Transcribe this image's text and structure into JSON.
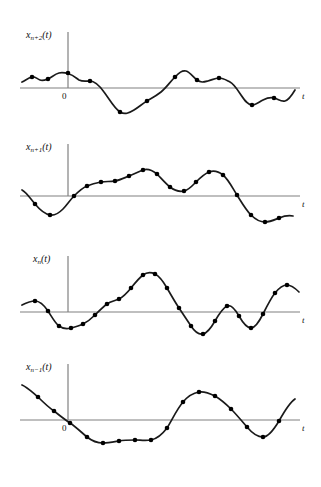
{
  "figure": {
    "kind": "multi-panel-waveform-diagram",
    "background_color": "#ffffff",
    "stroke_color": "#1a1a1a",
    "axis_color": "#808080",
    "sample_dot_color": "#000000",
    "width": 321,
    "height": 487
  },
  "ellipsis_top": {
    "name": "vertical-ellipsis-top",
    "dot_count": 3,
    "x": 158,
    "ys": [
      19,
      32,
      45
    ]
  },
  "ellipsis_bottom": {
    "name": "vertical-ellipsis-bottom",
    "dot_count": 3,
    "x": 158,
    "ys": [
      452,
      465,
      478
    ]
  },
  "panels": [
    {
      "id": "panel-xn-plus-2",
      "signal_label": "x",
      "signal_subscript": "n+2",
      "signal_arg": "(t)",
      "signal_label_full": "x_{n+2}(t)",
      "zero_label": "0",
      "t_label": "t",
      "top": 28,
      "baseline_y": 88,
      "y_axis_x": 68,
      "x_axis_from": 20,
      "x_axis_to": 300,
      "y_axis_top": 32,
      "label_x": 26,
      "label_y": 30,
      "zero_x": 62,
      "zero_y": 92,
      "t_x": 302,
      "t_y": 92,
      "curve": "M 22,82 C 26,80 28,78 32,77 C 35,76 37,79 40,80 C 43,81 45,80 48,79 C 52,77 55,74 59,73 C 63,72 66,73 69,74 C 73,75 76,78 79,80 C 83,82 86,81 90,81 C 95,81 99,85 104,92 C 110,100 114,108 120,112 C 125,115 129,113 134,110 C 139,107 142,104 147,101 C 152,98 156,96 161,92 C 166,88 170,82 175,77 C 179,73 182,70 186,71 C 190,72 193,77 197,80 C 201,83 204,82 208,81 C 212,80 215,78 219,78 C 223,78 226,80 230,82 C 234,84 237,89 241,95 C 245,101 248,105 252,105 C 256,105 259,102 263,100 C 267,98 270,97 274,98 C 278,99 281,102 285,101 C 289,100 292,95 295,90",
      "samples": [
        {
          "x": 32,
          "y": 77
        },
        {
          "x": 48,
          "y": 79
        },
        {
          "x": 68,
          "y": 73
        },
        {
          "x": 90,
          "y": 81
        },
        {
          "x": 120,
          "y": 112
        },
        {
          "x": 147,
          "y": 101
        },
        {
          "x": 175,
          "y": 77
        },
        {
          "x": 197,
          "y": 80
        },
        {
          "x": 219,
          "y": 78
        },
        {
          "x": 252,
          "y": 105
        },
        {
          "x": 274,
          "y": 98
        }
      ]
    },
    {
      "id": "panel-xn-plus-1",
      "signal_label": "x",
      "signal_subscript": "n+1",
      "signal_arg": "(t)",
      "signal_label_full": "x_{n+1}(t)",
      "zero_label": "",
      "t_label": "t",
      "top": 140,
      "baseline_y": 196,
      "y_axis_x": 68,
      "x_axis_from": 20,
      "x_axis_to": 300,
      "y_axis_top": 144,
      "label_x": 26,
      "label_y": 142,
      "zero_x": 62,
      "zero_y": 200,
      "t_x": 302,
      "t_y": 200,
      "curve": "M 22,190 C 26,192 30,198 35,204 C 40,210 45,214 50,215 C 55,216 59,213 63,209 C 67,205 70,200 74,196 C 78,192 82,188 87,186 C 92,184 96,183 101,182 C 106,181 110,182 115,181 C 120,180 124,178 129,176 C 134,174 138,172 143,170 C 148,168 152,170 157,174 C 161,178 165,183 170,187 C 175,191 179,192 184,191 C 189,190 192,186 196,182 C 200,178 204,174 209,172 C 214,170 218,171 223,175 C 228,179 232,187 237,195 C 242,203 246,210 251,215 C 256,220 260,222 265,222 C 270,222 274,220 279,218 C 284,216 288,215 293,216",
      "samples": [
        {
          "x": 35,
          "y": 204
        },
        {
          "x": 50,
          "y": 215
        },
        {
          "x": 74,
          "y": 196
        },
        {
          "x": 87,
          "y": 186
        },
        {
          "x": 101,
          "y": 182
        },
        {
          "x": 115,
          "y": 181
        },
        {
          "x": 129,
          "y": 176
        },
        {
          "x": 143,
          "y": 170
        },
        {
          "x": 157,
          "y": 174
        },
        {
          "x": 170,
          "y": 187
        },
        {
          "x": 184,
          "y": 191
        },
        {
          "x": 196,
          "y": 182
        },
        {
          "x": 209,
          "y": 172
        },
        {
          "x": 223,
          "y": 175
        },
        {
          "x": 237,
          "y": 195
        },
        {
          "x": 251,
          "y": 215
        },
        {
          "x": 265,
          "y": 222
        },
        {
          "x": 279,
          "y": 218
        }
      ]
    },
    {
      "id": "panel-xn",
      "signal_label": "x",
      "signal_subscript": "n",
      "signal_arg": "(t)",
      "signal_label_full": "x_n(t)",
      "zero_label": "",
      "t_label": "t",
      "top": 252,
      "baseline_y": 312,
      "y_axis_x": 68,
      "x_axis_from": 20,
      "x_axis_to": 300,
      "y_axis_top": 256,
      "label_x": 33,
      "label_y": 254,
      "zero_x": 62,
      "zero_y": 316,
      "t_x": 302,
      "t_y": 316,
      "curve": "M 22,305 C 26,303 30,301 35,301 C 40,301 44,305 48,311 C 52,317 55,323 59,326 C 63,329 67,329 71,328 C 75,327 79,326 83,324 C 87,322 91,319 95,315 C 99,311 103,307 107,304 C 111,301 115,301 119,299 C 123,297 127,293 131,288 C 135,283 139,278 143,275 C 147,272 151,272 155,274 C 159,276 163,281 167,288 C 171,295 175,302 179,308 C 183,314 187,320 191,326 C 195,332 199,335 203,334 C 207,333 211,328 215,321 C 219,314 223,308 227,306 C 231,304 235,309 239,316 C 243,323 247,328 251,328 C 255,328 259,322 263,314 C 267,306 271,298 275,293 C 279,288 283,285 287,285 C 291,285 295,288 299,292",
      "samples": [
        {
          "x": 35,
          "y": 301
        },
        {
          "x": 48,
          "y": 311
        },
        {
          "x": 59,
          "y": 326
        },
        {
          "x": 71,
          "y": 328
        },
        {
          "x": 83,
          "y": 324
        },
        {
          "x": 95,
          "y": 315
        },
        {
          "x": 107,
          "y": 304
        },
        {
          "x": 119,
          "y": 299
        },
        {
          "x": 131,
          "y": 288
        },
        {
          "x": 143,
          "y": 275
        },
        {
          "x": 155,
          "y": 274
        },
        {
          "x": 167,
          "y": 288
        },
        {
          "x": 179,
          "y": 308
        },
        {
          "x": 191,
          "y": 326
        },
        {
          "x": 203,
          "y": 334
        },
        {
          "x": 215,
          "y": 321
        },
        {
          "x": 227,
          "y": 306
        },
        {
          "x": 239,
          "y": 316
        },
        {
          "x": 251,
          "y": 328
        },
        {
          "x": 263,
          "y": 314
        },
        {
          "x": 275,
          "y": 293
        },
        {
          "x": 287,
          "y": 285
        }
      ]
    },
    {
      "id": "panel-xn-minus-1",
      "signal_label": "x",
      "signal_subscript": "n−1",
      "signal_arg": "(t)",
      "signal_label_full": "x_{n-1}(t)",
      "zero_label": "0",
      "t_label": "t",
      "top": 360,
      "baseline_y": 420,
      "y_axis_x": 68,
      "x_axis_from": 20,
      "x_axis_to": 300,
      "y_axis_top": 364,
      "label_x": 26,
      "label_y": 362,
      "zero_x": 62,
      "zero_y": 424,
      "t_x": 302,
      "t_y": 424,
      "curve": "M 22,385 C 27,387 32,392 38,397 C 43,402 48,407 54,411 C 59,415 64,419 70,423 C 76,427 81,432 87,437 C 92,441 97,443 103,443 C 108,443 113,442 119,441 C 124,440 129,440 135,440 C 140,440 145,441 151,440 C 156,439 161,436 167,428 C 172,420 177,409 183,402 C 188,396 193,393 199,392 C 204,391 209,393 215,396 C 220,399 225,403 231,409 C 236,414 241,420 247,427 C 252,433 257,437 263,437 C 268,437 273,431 279,421 C 284,412 289,403 295,399",
      "samples": [
        {
          "x": 38,
          "y": 397
        },
        {
          "x": 54,
          "y": 411
        },
        {
          "x": 70,
          "y": 423
        },
        {
          "x": 87,
          "y": 437
        },
        {
          "x": 103,
          "y": 443
        },
        {
          "x": 119,
          "y": 441
        },
        {
          "x": 135,
          "y": 440
        },
        {
          "x": 151,
          "y": 440
        },
        {
          "x": 167,
          "y": 428
        },
        {
          "x": 183,
          "y": 402
        },
        {
          "x": 199,
          "y": 392
        },
        {
          "x": 215,
          "y": 396
        },
        {
          "x": 231,
          "y": 409
        },
        {
          "x": 247,
          "y": 427
        },
        {
          "x": 263,
          "y": 437
        },
        {
          "x": 279,
          "y": 421
        }
      ]
    }
  ]
}
